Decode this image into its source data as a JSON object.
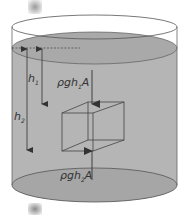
{
  "diagram": {
    "labels": {
      "h1": "h",
      "h1_sub": "1",
      "h2": "h",
      "h2_sub": "2",
      "force_top": "ρgh",
      "force_top_sub": "1",
      "force_top_suffix": "A",
      "force_bottom": "ρgh",
      "force_bottom_sub": "2",
      "force_bottom_suffix": "A"
    },
    "colors": {
      "liquid": "#b3b3b3",
      "liquid_surface": "#a8a8a8",
      "outline": "#555555",
      "rim": "#666666",
      "background": "#ffffff"
    },
    "elements": [
      {
        "id": "container",
        "type": "cylinder"
      },
      {
        "id": "liquid",
        "type": "fluid-fill"
      },
      {
        "id": "surface-reference",
        "type": "dashed-line"
      },
      {
        "id": "h1-arrow",
        "type": "dimension-arrow",
        "label": "h1"
      },
      {
        "id": "h2-arrow",
        "type": "dimension-arrow",
        "label": "h2"
      },
      {
        "id": "cube",
        "type": "wireframe-cube"
      },
      {
        "id": "top-force",
        "type": "force-arrow",
        "direction": "down",
        "label": "ρgh1A"
      },
      {
        "id": "bottom-force",
        "type": "force-arrow",
        "direction": "up",
        "label": "ρgh2A"
      }
    ]
  }
}
